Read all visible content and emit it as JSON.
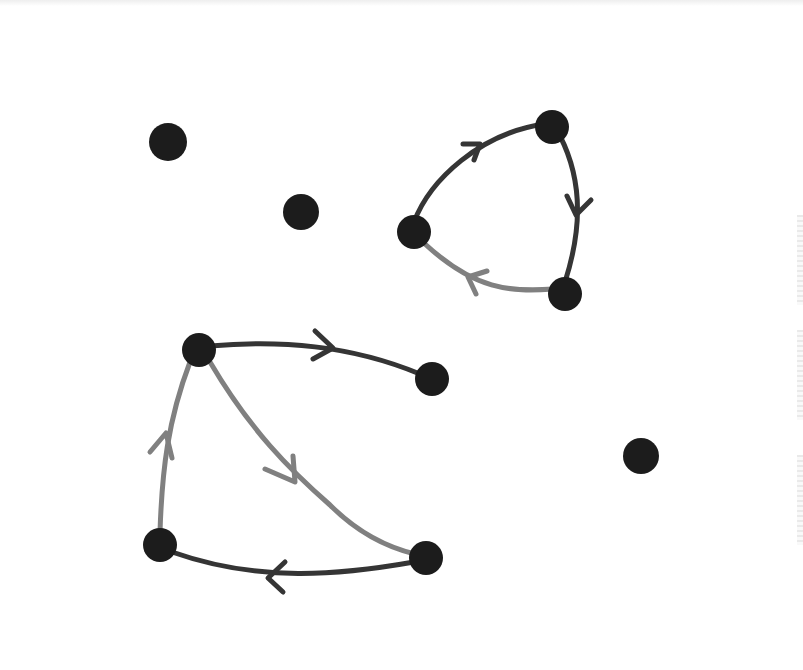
{
  "diagram": {
    "type": "directed-graph",
    "colors": {
      "background": "#ffffff",
      "node": "#1c1c1c",
      "edge_dark": "#353535",
      "edge_light": "#808080"
    },
    "nodes": [
      {
        "id": "a",
        "x": 168,
        "y": 142,
        "r": 19
      },
      {
        "id": "b",
        "x": 301,
        "y": 212,
        "r": 18
      },
      {
        "id": "c",
        "x": 552,
        "y": 127,
        "r": 17
      },
      {
        "id": "d",
        "x": 414,
        "y": 232,
        "r": 17
      },
      {
        "id": "e",
        "x": 565,
        "y": 294,
        "r": 17
      },
      {
        "id": "f",
        "x": 199,
        "y": 350,
        "r": 17
      },
      {
        "id": "g",
        "x": 432,
        "y": 379,
        "r": 17
      },
      {
        "id": "h",
        "x": 160,
        "y": 545,
        "r": 17
      },
      {
        "id": "i",
        "x": 426,
        "y": 558,
        "r": 17
      },
      {
        "id": "j",
        "x": 641,
        "y": 456,
        "r": 18
      }
    ],
    "edges": [
      {
        "from": "d",
        "to": "c",
        "shade": "dark"
      },
      {
        "from": "c",
        "to": "e",
        "shade": "dark"
      },
      {
        "from": "e",
        "to": "d",
        "shade": "light"
      },
      {
        "from": "f",
        "to": "g",
        "shade": "dark"
      },
      {
        "from": "f",
        "to": "i",
        "shade": "light"
      },
      {
        "from": "i",
        "to": "h",
        "shade": "dark"
      },
      {
        "from": "h",
        "to": "f",
        "shade": "light"
      }
    ]
  }
}
